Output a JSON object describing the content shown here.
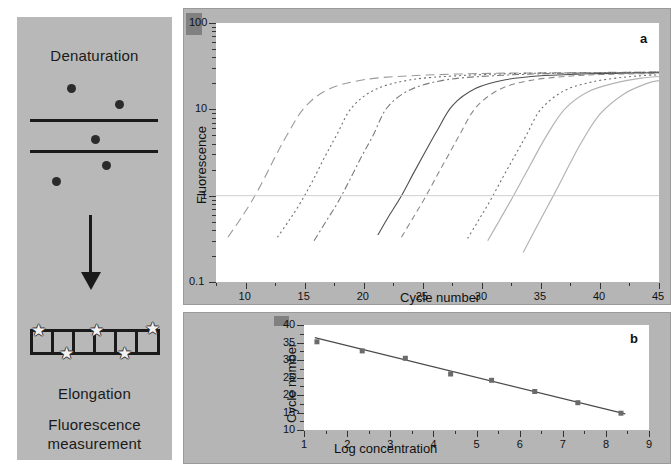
{
  "figure": {
    "schematic": {
      "title_top": "Denaturation",
      "label_elongation": "Elongation",
      "label_fluorescence_line1": "Fluorescence",
      "label_fluorescence_line2": "measurement",
      "arrow_icon": "arrow-down-icon",
      "star_icon": "star-icon",
      "dot_icon": "circle-dot-icon",
      "background_color": "#b8b8b8",
      "ink_color": "#1a1a1a"
    },
    "panels": [
      {
        "letter": "a"
      },
      {
        "letter": "b"
      }
    ]
  },
  "chart_data": [
    {
      "type": "line",
      "panel": "a",
      "title": "",
      "xlabel": "Cycle number",
      "ylabel": "Fluorescence",
      "xlim": [
        7.5,
        45
      ],
      "ylim": [
        0.1,
        100
      ],
      "yscale": "log",
      "grid": false,
      "legend": "none",
      "threshold": 1,
      "xticks": [
        10,
        15,
        20,
        25,
        30,
        35,
        40,
        45
      ],
      "xtick_labels": [
        "10",
        "15",
        "20",
        "25",
        "30",
        "35",
        "40",
        "45"
      ],
      "yticks": [
        0.1,
        1,
        10,
        100
      ],
      "ytick_labels": [
        "0.1",
        "1",
        "10",
        "100"
      ],
      "series": [
        {
          "name": "dilution-1",
          "style": "dash-long",
          "ct": 10.0,
          "x": [
            8.5,
            9.5,
            10.5,
            11.5,
            12.5,
            13.5,
            15,
            17,
            20,
            24,
            30,
            36,
            45
          ],
          "y": [
            0.33,
            0.52,
            0.85,
            1.5,
            2.8,
            5.0,
            10.5,
            17.0,
            22.0,
            24.5,
            26.0,
            26.5,
            27.0
          ]
        },
        {
          "name": "dilution-2",
          "style": "dot",
          "ct": 13.3,
          "x": [
            12.7,
            13.7,
            14.7,
            15.7,
            16.7,
            17.7,
            19,
            21,
            24,
            28,
            33,
            39,
            45
          ],
          "y": [
            0.33,
            0.52,
            0.85,
            1.5,
            2.8,
            5.0,
            10.5,
            17.0,
            22.0,
            24.5,
            26.0,
            26.5,
            27.0
          ]
        },
        {
          "name": "dilution-3",
          "style": "dash-dot",
          "ct": 16.4,
          "x": [
            15.8,
            16.8,
            17.8,
            18.8,
            19.8,
            20.8,
            22,
            24,
            27,
            31,
            36,
            41,
            45
          ],
          "y": [
            0.3,
            0.5,
            0.83,
            1.5,
            2.8,
            5.0,
            10.5,
            17.0,
            22.0,
            24.5,
            26.0,
            26.5,
            27.0
          ]
        },
        {
          "name": "dilution-4",
          "style": "solid",
          "ct": 22.2,
          "x": [
            21.2,
            22.2,
            23.2,
            24.2,
            25.2,
            26.2,
            27.5,
            29.5,
            32,
            35,
            39,
            42,
            45
          ],
          "y": [
            0.35,
            0.6,
            1.0,
            1.8,
            3.2,
            5.6,
            11.0,
            17.5,
            22.0,
            24.5,
            25.8,
            26.2,
            26.5
          ]
        },
        {
          "name": "dilution-5",
          "style": "dash-medium",
          "ct": 24.2,
          "x": [
            23.2,
            24.2,
            25.2,
            26.2,
            27.2,
            28.2,
            29.5,
            31.5,
            34,
            37,
            40,
            43,
            45
          ],
          "y": [
            0.33,
            0.56,
            0.95,
            1.7,
            3.0,
            5.3,
            10.5,
            17.0,
            21.5,
            24.0,
            25.3,
            25.8,
            26.0
          ]
        },
        {
          "name": "dilution-6",
          "style": "dot",
          "ct": 29.8,
          "x": [
            28.8,
            29.8,
            30.8,
            31.8,
            32.8,
            33.8,
            35,
            37,
            39.5,
            42,
            44,
            45
          ],
          "y": [
            0.32,
            0.54,
            0.92,
            1.65,
            2.9,
            5.1,
            10.0,
            16.5,
            21.0,
            23.5,
            24.8,
            25.0
          ]
        },
        {
          "name": "dilution-7",
          "style": "solid-light",
          "ct": 31.5,
          "x": [
            30.5,
            31.5,
            32.5,
            33.5,
            34.5,
            35.5,
            37,
            39,
            41.5,
            43.5,
            45
          ],
          "y": [
            0.3,
            0.52,
            0.9,
            1.6,
            2.85,
            5.0,
            10.0,
            16.0,
            20.5,
            23.0,
            24.0
          ]
        },
        {
          "name": "dilution-8",
          "style": "solid-light",
          "ct": 35.0,
          "x": [
            33.5,
            34.5,
            35.5,
            36.5,
            37.5,
            38.5,
            40,
            42,
            44,
            45
          ],
          "y": [
            0.22,
            0.4,
            0.72,
            1.3,
            2.4,
            4.3,
            8.8,
            15.0,
            20.0,
            21.5
          ]
        }
      ]
    },
    {
      "type": "scatter",
      "panel": "b",
      "title": "",
      "xlabel": "Log concentration",
      "ylabel": "Cycle number",
      "xlim": [
        1,
        9
      ],
      "ylim": [
        10,
        40
      ],
      "grid": false,
      "legend": "none",
      "xticks": [
        1,
        2,
        3,
        4,
        5,
        6,
        7,
        8,
        9
      ],
      "xtick_labels": [
        "1",
        "2",
        "3",
        "4",
        "5",
        "6",
        "7",
        "8",
        "9"
      ],
      "yticks": [
        10,
        15,
        20,
        25,
        30,
        35,
        40
      ],
      "ytick_labels": [
        "10",
        "15",
        "20",
        "25",
        "30",
        "35",
        "40"
      ],
      "points": [
        {
          "x": 1.3,
          "y": 35.2
        },
        {
          "x": 2.35,
          "y": 32.6
        },
        {
          "x": 3.35,
          "y": 30.5
        },
        {
          "x": 4.4,
          "y": 26.0
        },
        {
          "x": 5.35,
          "y": 24.2
        },
        {
          "x": 6.35,
          "y": 21.0
        },
        {
          "x": 7.35,
          "y": 17.8
        },
        {
          "x": 8.35,
          "y": 14.8
        }
      ],
      "fit_line": {
        "x": [
          1.25,
          8.45
        ],
        "y": [
          36.4,
          14.6
        ],
        "slope": -3.03,
        "intercept": 40.2
      }
    }
  ]
}
